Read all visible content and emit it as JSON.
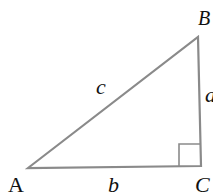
{
  "diagram": {
    "type": "right-triangle",
    "stroke_color": "#8a8a8a",
    "text_color": "#111111",
    "vertices": {
      "A": {
        "label": "A",
        "x": 28,
        "y": 168
      },
      "B": {
        "label": "B",
        "x": 198,
        "y": 37
      },
      "C": {
        "label": "C",
        "x": 201,
        "y": 166
      }
    },
    "sides": {
      "hypotenuse": {
        "label": "c",
        "from": "A",
        "to": "B"
      },
      "base": {
        "label": "b",
        "from": "A",
        "to": "C"
      },
      "vertical": {
        "label": "a",
        "from": "C",
        "to": "B"
      }
    },
    "right_angle_marker": {
      "at": "C",
      "size": 21
    }
  }
}
